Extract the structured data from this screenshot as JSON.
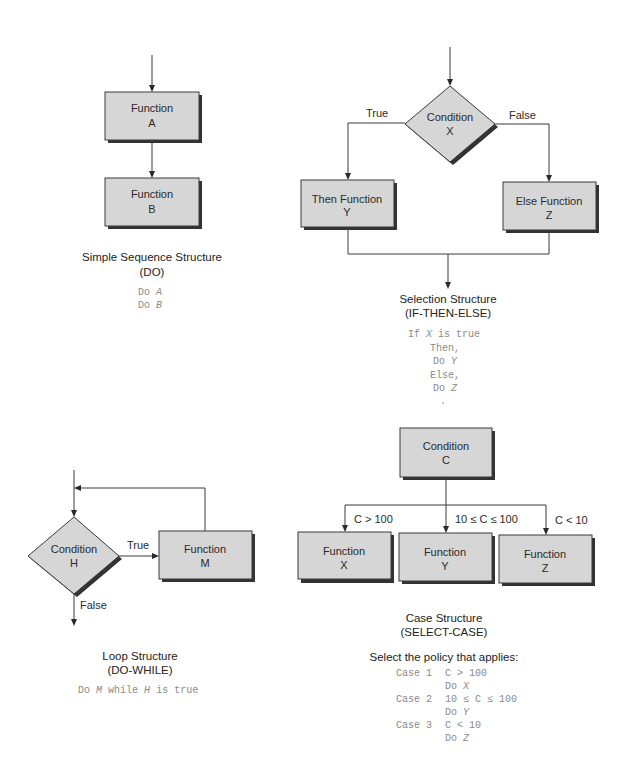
{
  "sequence": {
    "box_a": {
      "line1": "Function",
      "line2": "A"
    },
    "box_b": {
      "line1": "Function",
      "line2": "B"
    },
    "title": "Simple Sequence Structure",
    "subtitle": "(DO)",
    "code": [
      {
        "kw": "Do",
        "var": "A"
      },
      {
        "kw": "Do",
        "var": "B"
      }
    ]
  },
  "selection": {
    "condition": {
      "line1": "Condition",
      "line2": "X"
    },
    "true_label": "True",
    "false_label": "False",
    "then_box": {
      "line1": "Then Function",
      "line2": "Y"
    },
    "else_box": {
      "line1": "Else Function",
      "line2": "Z"
    },
    "title": "Selection Structure",
    "subtitle": "(IF-THEN-ELSE)",
    "code": {
      "if_kw": "If",
      "if_var": "X",
      "if_rest": "is true",
      "then": "Then,",
      "do_y_kw": "Do",
      "do_y_var": "Y",
      "else": "Else,",
      "do_z_kw": "Do",
      "do_z_var": "Z",
      "dot": "."
    }
  },
  "loop": {
    "condition": {
      "line1": "Condition",
      "line2": "H"
    },
    "true_label": "True",
    "false_label": "False",
    "function_box": {
      "line1": "Function",
      "line2": "M"
    },
    "title": "Loop Structure",
    "subtitle": "(DO-WHILE)",
    "code": {
      "kw": "Do",
      "var1": "M",
      "mid": "while",
      "var2": "H",
      "rest": "is true"
    }
  },
  "case": {
    "condition": {
      "line1": "Condition",
      "line2": "C"
    },
    "branches": [
      {
        "label": "C > 100",
        "line1": "Function",
        "line2": "X"
      },
      {
        "label": "10 ≤ C ≤ 100",
        "line1": "Function",
        "line2": "Y"
      },
      {
        "label": "C < 10",
        "line1": "Function",
        "line2": "Z"
      }
    ],
    "title": "Case Structure",
    "subtitle": "(SELECT-CASE)",
    "policy_heading": "Select the policy that applies:",
    "policies": [
      {
        "case": "Case 1",
        "cond": "C > 100",
        "do_kw": "Do",
        "do_var": "X"
      },
      {
        "case": "Case 2",
        "cond": "10 ≤ C ≤ 100",
        "do_kw": "Do",
        "do_var": "Y"
      },
      {
        "case": "Case 3",
        "cond": "C < 10",
        "do_kw": "Do",
        "do_var": "Z"
      }
    ]
  }
}
